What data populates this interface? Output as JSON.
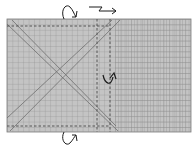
{
  "diagram": {
    "type": "origami-fold-diagram",
    "paper": {
      "x": 7,
      "y": 19,
      "width": 184,
      "height": 113,
      "fill": "#c4c4c4",
      "grid_color": "#8f8f8f",
      "grid_spacing": 5.4
    },
    "dense_region": {
      "x": 115,
      "y": 19,
      "width": 76,
      "height": 113,
      "vertical_spacing": 3.2
    },
    "crease_lines": [
      {
        "name": "diagonal-down",
        "x1": 7,
        "y1": 24,
        "x2": 118,
        "y2": 131
      },
      {
        "name": "diagonal-up",
        "x1": 7,
        "y1": 118,
        "x2": 112,
        "y2": 20
      },
      {
        "name": "diagonal-down-2",
        "x1": 12,
        "y1": 20,
        "x2": 112,
        "y2": 124
      },
      {
        "name": "diagonal-up-2",
        "x1": 10,
        "y1": 131,
        "x2": 120,
        "y2": 20
      }
    ],
    "dashed_lines": [
      {
        "name": "valley-fold-top",
        "x1": 7,
        "y1": 26,
        "x2": 110,
        "y2": 26
      },
      {
        "name": "valley-fold-bottom",
        "x1": 7,
        "y1": 126,
        "x2": 110,
        "y2": 126
      },
      {
        "name": "valley-fold-left-vertical",
        "x1": 97,
        "y1": 19,
        "x2": 97,
        "y2": 132
      },
      {
        "name": "valley-fold-right-vertical",
        "x1": 110,
        "y1": 19,
        "x2": 110,
        "y2": 132
      }
    ],
    "arrows": [
      {
        "name": "turn-over-arrow-top",
        "kind": "loop"
      },
      {
        "name": "zigzag-arrow-top",
        "kind": "pleat"
      },
      {
        "name": "fold-behind-arrow-middle",
        "kind": "curved"
      },
      {
        "name": "turn-over-arrow-bottom",
        "kind": "loop"
      }
    ],
    "ink_color": "#1a1a1a"
  }
}
